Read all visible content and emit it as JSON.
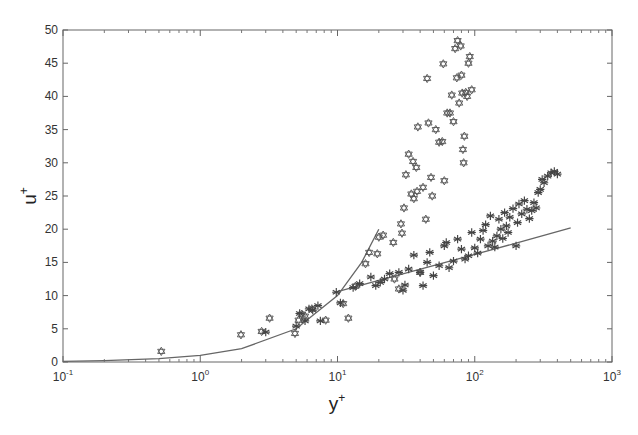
{
  "chart_data": {
    "type": "scatter",
    "title": "",
    "xlabel": "y+",
    "ylabel": "u+",
    "xscale": "log",
    "xlim": [
      0.1,
      1000
    ],
    "ylim": [
      0,
      50
    ],
    "x_ticks": [
      "10^-1",
      "10^0",
      "10^1",
      "10^2",
      "10^3"
    ],
    "y_ticks": [
      0,
      5,
      10,
      15,
      20,
      25,
      30,
      35,
      40,
      45,
      50
    ],
    "grid": false,
    "legend": null,
    "series": [
      {
        "name": "hexagram markers (open)",
        "marker": "hexagram",
        "points": [
          [
            0.52,
            1.6
          ],
          [
            1.98,
            4.1
          ],
          [
            2.8,
            4.6
          ],
          [
            3.2,
            6.6
          ],
          [
            4.9,
            4.3
          ],
          [
            5.2,
            6.3
          ],
          [
            5.5,
            7.2
          ],
          [
            5.8,
            6.9
          ],
          [
            6.5,
            8.0
          ],
          [
            8.2,
            6.3
          ],
          [
            11.0,
            8.8
          ],
          [
            12.0,
            6.6
          ],
          [
            13.5,
            11.4
          ],
          [
            16.0,
            14.8
          ],
          [
            17.0,
            16.5
          ],
          [
            19.5,
            16.3
          ],
          [
            20.0,
            18.8
          ],
          [
            21.5,
            19.1
          ],
          [
            25.5,
            18.0
          ],
          [
            26.0,
            12.5
          ],
          [
            28.0,
            11.0
          ],
          [
            29.0,
            20.8
          ],
          [
            29.5,
            19.4
          ],
          [
            30.5,
            23.2
          ],
          [
            31.5,
            28.2
          ],
          [
            33.0,
            31.3
          ],
          [
            34.5,
            25.3
          ],
          [
            35.5,
            30.2
          ],
          [
            36.0,
            24.6
          ],
          [
            37.5,
            29.3
          ],
          [
            38.0,
            25.7
          ],
          [
            38.5,
            35.4
          ],
          [
            40.0,
            13.5
          ],
          [
            42.0,
            26.3
          ],
          [
            44.0,
            21.5
          ],
          [
            45.0,
            42.7
          ],
          [
            46.0,
            36.0
          ],
          [
            48.0,
            27.8
          ],
          [
            49.0,
            25.0
          ],
          [
            52.0,
            35.0
          ],
          [
            55.0,
            33.1
          ],
          [
            58.0,
            33.2
          ],
          [
            59.0,
            44.9
          ],
          [
            60.0,
            27.3
          ],
          [
            63.0,
            37.5
          ],
          [
            66.0,
            37.5
          ],
          [
            68.0,
            40.2
          ],
          [
            70.0,
            36.2
          ],
          [
            72.0,
            47.2
          ],
          [
            74.0,
            42.8
          ],
          [
            75.0,
            48.4
          ],
          [
            77.0,
            39.0
          ],
          [
            79.0,
            47.6
          ],
          [
            80.0,
            43.2
          ],
          [
            81.0,
            40.5
          ],
          [
            82.0,
            32.0
          ],
          [
            83.0,
            30.0
          ],
          [
            84.0,
            34.0
          ],
          [
            86.0,
            40.6
          ],
          [
            88.0,
            40.0
          ],
          [
            90.0,
            45.0
          ],
          [
            92.0,
            46.0
          ],
          [
            95.0,
            41.0
          ]
        ]
      },
      {
        "name": "asterisk markers (filled)",
        "marker": "asterisk",
        "points": [
          [
            3.0,
            4.5
          ],
          [
            5.0,
            5.4
          ],
          [
            5.3,
            7.3
          ],
          [
            5.8,
            6.2
          ],
          [
            6.2,
            8.0
          ],
          [
            6.6,
            7.8
          ],
          [
            7.2,
            8.5
          ],
          [
            7.5,
            6.2
          ],
          [
            9.8,
            10.5
          ],
          [
            10.5,
            8.9
          ],
          [
            13.0,
            11.2
          ],
          [
            14.5,
            11.8
          ],
          [
            17.5,
            12.8
          ],
          [
            19.0,
            11.5
          ],
          [
            20.5,
            12.0
          ],
          [
            22.0,
            12.5
          ],
          [
            24.0,
            13.3
          ],
          [
            28.0,
            13.5
          ],
          [
            30.0,
            10.8
          ],
          [
            31.0,
            11.6
          ],
          [
            33.0,
            14.0
          ],
          [
            36.0,
            16.1
          ],
          [
            40.0,
            13.5
          ],
          [
            42.0,
            11.5
          ],
          [
            45.0,
            15.0
          ],
          [
            47.0,
            16.5
          ],
          [
            50.0,
            13.0
          ],
          [
            55.0,
            14.5
          ],
          [
            60.0,
            17.5
          ],
          [
            62.0,
            18.0
          ],
          [
            65.0,
            14.2
          ],
          [
            70.0,
            15.2
          ],
          [
            75.0,
            18.5
          ],
          [
            80.0,
            17.0
          ],
          [
            85.0,
            15.5
          ],
          [
            90.0,
            16.0
          ],
          [
            95.0,
            19.5
          ],
          [
            100.0,
            17.2
          ],
          [
            105.0,
            16.4
          ],
          [
            110.0,
            18.5
          ],
          [
            115.0,
            19.8
          ],
          [
            120.0,
            20.7
          ],
          [
            125.0,
            17.5
          ],
          [
            130.0,
            22.0
          ],
          [
            135.0,
            18.2
          ],
          [
            140.0,
            17.3
          ],
          [
            145.0,
            19.0
          ],
          [
            150.0,
            21.5
          ],
          [
            155.0,
            20.0
          ],
          [
            160.0,
            18.6
          ],
          [
            165.0,
            22.5
          ],
          [
            170.0,
            20.5
          ],
          [
            175.0,
            19.5
          ],
          [
            180.0,
            21.8
          ],
          [
            190.0,
            23.1
          ],
          [
            200.0,
            17.5
          ],
          [
            205.0,
            21.0
          ],
          [
            210.0,
            23.8
          ],
          [
            220.0,
            22.3
          ],
          [
            230.0,
            24.3
          ],
          [
            240.0,
            23.0
          ],
          [
            250.0,
            21.6
          ],
          [
            260.0,
            22.8
          ],
          [
            270.0,
            24.0
          ],
          [
            280.0,
            23.2
          ],
          [
            290.0,
            25.5
          ],
          [
            300.0,
            26.0
          ],
          [
            310.0,
            27.5
          ],
          [
            320.0,
            27.0
          ],
          [
            340.0,
            28.0
          ],
          [
            360.0,
            28.5
          ],
          [
            380.0,
            28.7
          ],
          [
            400.0,
            28.3
          ]
        ]
      },
      {
        "name": "viscous sublayer u+ = y+",
        "marker": "line",
        "points": [
          [
            0.1,
            0.1
          ],
          [
            0.2,
            0.2
          ],
          [
            0.5,
            0.5
          ],
          [
            1,
            1
          ],
          [
            2,
            2
          ],
          [
            5,
            5
          ],
          [
            10,
            10
          ],
          [
            15,
            15
          ],
          [
            20,
            20
          ]
        ]
      },
      {
        "name": "log law u+ = (1/0.41) ln y+ + 5.0",
        "marker": "line",
        "points": [
          [
            10,
            10.6
          ],
          [
            20,
            12.3
          ],
          [
            50,
            14.5
          ],
          [
            100,
            16.2
          ],
          [
            200,
            17.9
          ],
          [
            500,
            20.2
          ]
        ]
      }
    ]
  }
}
